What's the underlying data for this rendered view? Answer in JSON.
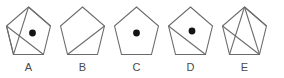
{
  "figure": {
    "background_color": "#ffffff",
    "stroke_color": "#6b6b6b",
    "dot_color": "#141414",
    "label_color": "#4a4a4a",
    "count": 5
  },
  "items": [
    {
      "label": "A",
      "shape": "pentagon",
      "has_dot": true,
      "dot": {
        "cx": 30.5,
        "cy": 31.0,
        "r": 3.4
      },
      "chords": [
        {
          "name": "chord-top-to-bottom-left",
          "x1": 26.5,
          "y1": 5.0,
          "x2": 11.5,
          "y2": 52.5
        },
        {
          "name": "chord-left-to-bottom-right",
          "x1": 4.5,
          "y1": 24.0,
          "x2": 41.5,
          "y2": 52.5
        },
        {
          "name": "chord-left-to-bottom-left",
          "x1": 4.5,
          "y1": 24.0,
          "x2": 11.5,
          "y2": 52.5
        },
        {
          "name": "chord-top-to-right",
          "x1": 26.5,
          "y1": 5.0,
          "x2": 48.5,
          "y2": 24.0
        }
      ]
    },
    {
      "label": "B",
      "shape": "pentagon",
      "has_dot": false,
      "dot": null,
      "chords": [
        {
          "name": "chord-bottom-left-to-right",
          "x1": 11.5,
          "y1": 52.5,
          "x2": 48.5,
          "y2": 24.0
        }
      ]
    },
    {
      "label": "C",
      "shape": "pentagon",
      "has_dot": true,
      "dot": {
        "cx": 26.5,
        "cy": 31.0,
        "r": 3.4
      },
      "chords": []
    },
    {
      "label": "D",
      "shape": "pentagon",
      "has_dot": true,
      "dot": {
        "cx": 28.0,
        "cy": 29.0,
        "r": 3.4
      },
      "chords": [
        {
          "name": "chord-left-to-bottom-right",
          "x1": 4.5,
          "y1": 24.0,
          "x2": 41.5,
          "y2": 52.5
        }
      ]
    },
    {
      "label": "E",
      "shape": "pentagon",
      "has_dot": false,
      "dot": null,
      "chords": [
        {
          "name": "chord-top-to-bottom-left",
          "x1": 26.5,
          "y1": 5.0,
          "x2": 11.5,
          "y2": 52.5
        },
        {
          "name": "chord-top-to-bottom-right",
          "x1": 26.5,
          "y1": 5.0,
          "x2": 41.5,
          "y2": 52.5
        },
        {
          "name": "chord-left-to-bottom-right",
          "x1": 4.5,
          "y1": 24.0,
          "x2": 41.5,
          "y2": 52.5
        },
        {
          "name": "chord-top-to-right",
          "x1": 26.5,
          "y1": 5.0,
          "x2": 48.5,
          "y2": 24.0
        }
      ]
    }
  ],
  "geometry": {
    "pentagon_points": "26.5,5.0 48.5,24.0 41.5,52.5 11.5,52.5 4.5,24.0",
    "cell_width": 53,
    "cell_xs": [
      2,
      56,
      110,
      164,
      218
    ]
  }
}
